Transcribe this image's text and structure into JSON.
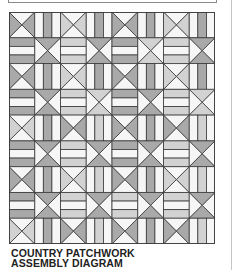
{
  "caption": {
    "line1": "COUNTRY PATCHWORK",
    "line2": "ASSEMBLY DIAGRAM"
  },
  "colors": {
    "mid": "#a9a9a9",
    "light": "#d2d2d2",
    "white": "#f6f6f6",
    "line": "#3a3a3a"
  },
  "quilt": {
    "cols": 8,
    "rows": 9,
    "cell_w": 25.75,
    "cell_h": 25.78,
    "grid": [
      [
        {
          "t": "xlr",
          "s": "mid"
        },
        {
          "t": "v",
          "s": "mid"
        },
        {
          "t": "xlr",
          "s": "light"
        },
        {
          "t": "v",
          "s": "mid"
        },
        {
          "t": "xlr",
          "s": "mid"
        },
        {
          "t": "v",
          "s": "mid"
        },
        {
          "t": "xlr",
          "s": "light"
        },
        {
          "t": "v",
          "s": "mid"
        }
      ],
      [
        {
          "t": "h",
          "s": "mid"
        },
        {
          "t": "xtb",
          "s": "mid"
        },
        {
          "t": "h",
          "s": "light"
        },
        {
          "t": "xtb",
          "s": "mid"
        },
        {
          "t": "h",
          "s": "mid"
        },
        {
          "t": "xtb",
          "s": "light"
        },
        {
          "t": "h",
          "s": "light"
        },
        {
          "t": "xtb",
          "s": "mid"
        }
      ],
      [
        {
          "t": "xlr",
          "s": "mid"
        },
        {
          "t": "v",
          "s": "mid"
        },
        {
          "t": "xlr",
          "s": "light"
        },
        {
          "t": "v",
          "s": "mid"
        },
        {
          "t": "xlr",
          "s": "mid"
        },
        {
          "t": "v",
          "s": "mid"
        },
        {
          "t": "xlr",
          "s": "light"
        },
        {
          "t": "v",
          "s": "mid"
        }
      ],
      [
        {
          "t": "h",
          "s": "mid"
        },
        {
          "t": "xtb",
          "s": "mid"
        },
        {
          "t": "h",
          "s": "light"
        },
        {
          "t": "xtb",
          "s": "light"
        },
        {
          "t": "h",
          "s": "mid"
        },
        {
          "t": "xtb",
          "s": "mid"
        },
        {
          "t": "h",
          "s": "light"
        },
        {
          "t": "xtb",
          "s": "light"
        }
      ],
      [
        {
          "t": "xlr",
          "s": "light"
        },
        {
          "t": "v",
          "s": "mid"
        },
        {
          "t": "xlr",
          "s": "mid"
        },
        {
          "t": "v",
          "s": "light"
        },
        {
          "t": "xlr",
          "s": "mid"
        },
        {
          "t": "v",
          "s": "mid"
        },
        {
          "t": "xlr",
          "s": "mid"
        },
        {
          "t": "v",
          "s": "light"
        }
      ],
      [
        {
          "t": "h",
          "s": "mid"
        },
        {
          "t": "xtb",
          "s": "mid"
        },
        {
          "t": "h",
          "s": "light"
        },
        {
          "t": "xtb",
          "s": "mid"
        },
        {
          "t": "h",
          "s": "mid"
        },
        {
          "t": "xtb",
          "s": "mid"
        },
        {
          "t": "h",
          "s": "light"
        },
        {
          "t": "xtb",
          "s": "mid"
        }
      ],
      [
        {
          "t": "xlr",
          "s": "mid"
        },
        {
          "t": "v",
          "s": "mid"
        },
        {
          "t": "xlr",
          "s": "light"
        },
        {
          "t": "v",
          "s": "light"
        },
        {
          "t": "xlr",
          "s": "mid"
        },
        {
          "t": "v",
          "s": "mid"
        },
        {
          "t": "xlr",
          "s": "light"
        },
        {
          "t": "v",
          "s": "light"
        }
      ],
      [
        {
          "t": "h",
          "s": "mid"
        },
        {
          "t": "xtb",
          "s": "mid"
        },
        {
          "t": "h",
          "s": "light"
        },
        {
          "t": "xtb",
          "s": "mid"
        },
        {
          "t": "h",
          "s": "light"
        },
        {
          "t": "xtb",
          "s": "mid"
        },
        {
          "t": "h",
          "s": "light"
        },
        {
          "t": "xtb",
          "s": "mid"
        }
      ],
      [
        {
          "t": "xlr",
          "s": "light"
        },
        {
          "t": "v",
          "s": "mid"
        },
        {
          "t": "xlr",
          "s": "mid"
        },
        {
          "t": "v",
          "s": "light"
        },
        {
          "t": "xlr",
          "s": "mid"
        },
        {
          "t": "v",
          "s": "mid"
        },
        {
          "t": "xlr",
          "s": "mid"
        },
        {
          "t": "v",
          "s": "light"
        }
      ]
    ]
  }
}
